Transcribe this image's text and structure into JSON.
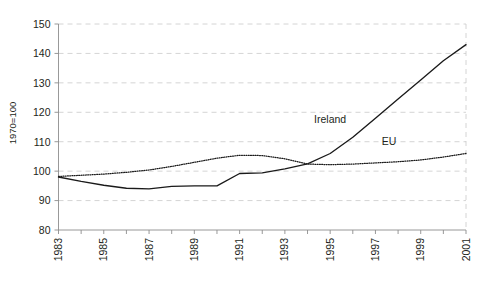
{
  "chart_data": {
    "type": "line",
    "title": "",
    "subtitle": "",
    "xlabel": "",
    "ylabel": "1970=100",
    "ylim": [
      80,
      150
    ],
    "yticks": [
      80,
      90,
      100,
      110,
      120,
      130,
      140,
      150
    ],
    "xlim": [
      1983,
      2001
    ],
    "x": [
      1983,
      1984,
      1985,
      1986,
      1987,
      1988,
      1989,
      1990,
      1991,
      1992,
      1993,
      1994,
      1995,
      1996,
      1997,
      1998,
      1999,
      2000,
      2001
    ],
    "xticks": [
      1983,
      1984,
      1985,
      1986,
      1987,
      1988,
      1989,
      1990,
      1991,
      1992,
      1993,
      1994,
      1995,
      1996,
      1997,
      1998,
      1999,
      2000,
      2001
    ],
    "xtick_labels": [
      "1983",
      "",
      "1985",
      "",
      "1987",
      "",
      "1989",
      "",
      "1991",
      "",
      "1993",
      "",
      "1995",
      "",
      "1997",
      "",
      "1999",
      "",
      "2001"
    ],
    "grid": true,
    "grid_axis": "y",
    "legend_position": "inline-annotation",
    "series": [
      {
        "name": "Ireland",
        "style": "solid",
        "color": "#1a1a1a",
        "label_position": {
          "x": 1995.0,
          "y": 116.5
        },
        "values": [
          98.0,
          96.5,
          95.2,
          94.2,
          94.0,
          94.8,
          95.0,
          95.0,
          99.2,
          99.4,
          100.8,
          102.5,
          106.0,
          111.5,
          118.0,
          124.5,
          131.0,
          137.5,
          143.0
        ]
      },
      {
        "name": "EU",
        "style": "dotted",
        "color": "#1a1a1a",
        "label_position": {
          "x": 1997.6,
          "y": 108.8
        },
        "values": [
          98.2,
          98.6,
          99.0,
          99.6,
          100.4,
          101.6,
          103.0,
          104.4,
          105.4,
          105.3,
          104.2,
          102.4,
          102.2,
          102.4,
          102.8,
          103.2,
          103.8,
          104.8,
          106.0
        ]
      }
    ],
    "annotations": [
      {
        "text": "Ireland",
        "kind": "series-label"
      },
      {
        "text": "EU",
        "kind": "series-label"
      }
    ]
  },
  "axes": {
    "y_axis_title": "1970=100"
  }
}
